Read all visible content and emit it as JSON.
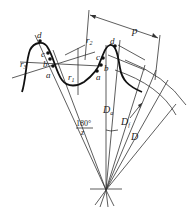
{
  "diagram": {
    "labels": {
      "pitch": "p",
      "point_d_left": "d",
      "point_c_left": "c",
      "point_b_left": "b",
      "point_a_left": "a",
      "point_d_right": "d",
      "point_c_right": "c",
      "point_b_right": "b",
      "point_a_right": "a",
      "r1": "r",
      "r1_sub": "1",
      "r2": "r",
      "r2_sub": "2",
      "r3": "r",
      "r3_sub": "3",
      "angle_num": "180°",
      "angle_den": "z",
      "Da": "D",
      "Da_sub": "a",
      "Df": "D",
      "Df_sub": "f",
      "D": "D"
    }
  }
}
